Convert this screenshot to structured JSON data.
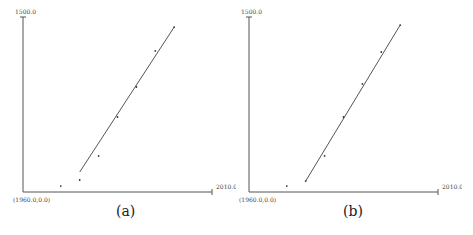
{
  "chart_data": [
    {
      "type": "scatter",
      "panel_label": "(a)",
      "title": "",
      "xlabel": "",
      "ylabel": "",
      "xlim": [
        1960,
        2010
      ],
      "ylim": [
        0,
        1500
      ],
      "origin_label": "(1960.0,0.0)",
      "x_max_label": "2010.0",
      "y_max_label": "1500.0",
      "grid": false,
      "points": [
        {
          "x": 1970,
          "y": 51
        },
        {
          "x": 1975,
          "y": 103
        },
        {
          "x": 1980,
          "y": 309
        },
        {
          "x": 1985,
          "y": 643
        },
        {
          "x": 1990,
          "y": 900
        },
        {
          "x": 1995,
          "y": 1209
        },
        {
          "x": 2000,
          "y": 1414
        }
      ],
      "fit_line": {
        "x0": 1975,
        "y0": 171,
        "x1": 2000,
        "y1": 1414
      }
    },
    {
      "type": "scatter",
      "panel_label": "(b)",
      "title": "",
      "xlabel": "",
      "ylabel": "",
      "xlim": [
        1960,
        2010
      ],
      "ylim": [
        0,
        1500
      ],
      "origin_label": "(1960.0,0.0)",
      "x_max_label": "2010.0",
      "y_max_label": "1500.0",
      "grid": false,
      "points": [
        {
          "x": 1970,
          "y": 51
        },
        {
          "x": 1975,
          "y": 94
        },
        {
          "x": 1980,
          "y": 309
        },
        {
          "x": 1985,
          "y": 643
        },
        {
          "x": 1990,
          "y": 926
        },
        {
          "x": 1995,
          "y": 1200
        },
        {
          "x": 2000,
          "y": 1431
        }
      ],
      "fit_line": {
        "x0": 1975,
        "y0": 94,
        "x1": 2000,
        "y1": 1431
      }
    }
  ],
  "colors": {
    "axis": "#555555",
    "line": "#555555",
    "point": "#333333"
  }
}
